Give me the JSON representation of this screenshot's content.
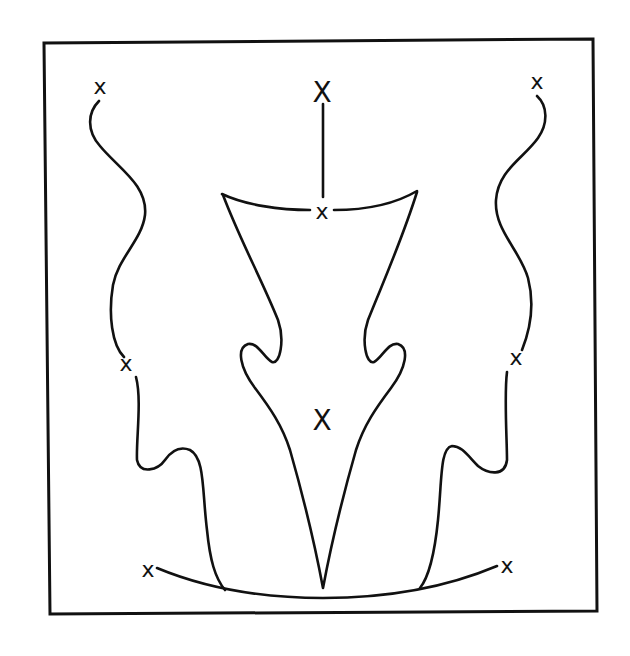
{
  "diagram": {
    "type": "line-drawing",
    "colors": {
      "line": "#111111",
      "background": "#ffffff"
    },
    "frame": {
      "points": "44,43 593,39 597,611 50,614"
    },
    "markers": [
      {
        "id": "top-left",
        "label": "x",
        "x": 100,
        "y": 86,
        "size": 22
      },
      {
        "id": "top-center",
        "label": "X",
        "x": 322,
        "y": 92,
        "size": 28
      },
      {
        "id": "top-right",
        "label": "x",
        "x": 537,
        "y": 81,
        "size": 22
      },
      {
        "id": "neck",
        "label": "x",
        "x": 322,
        "y": 211,
        "size": 22
      },
      {
        "id": "mid-left",
        "label": "x",
        "x": 126,
        "y": 363,
        "size": 22
      },
      {
        "id": "mid-right",
        "label": "x",
        "x": 516,
        "y": 357,
        "size": 22
      },
      {
        "id": "center",
        "label": "X",
        "x": 322,
        "y": 420,
        "size": 28
      },
      {
        "id": "bottom-left",
        "label": "x",
        "x": 148,
        "y": 569,
        "size": 22
      },
      {
        "id": "bottom-right",
        "label": "x",
        "x": 507,
        "y": 565,
        "size": 22
      }
    ],
    "paths": [
      {
        "id": "left-upper-curve",
        "d": "M 99 101 C 88 112, 86 130, 100 146 C 118 168, 148 185, 145 215 C 142 240, 118 258, 113 285 C 108 315, 112 345, 124 357"
      },
      {
        "id": "left-lower-curve",
        "d": "M 136 377 C 142 400, 136 440, 137 460 C 140 475, 158 470, 165 460 C 172 450, 180 446, 190 450 C 205 458, 202 490, 207 530 C 210 560, 215 578, 225 590"
      },
      {
        "id": "right-upper-curve",
        "d": "M 537 96 C 548 106, 548 124, 538 138 C 524 158, 498 170, 496 200 C 494 230, 520 250, 528 278 C 535 305, 530 330, 522 350"
      },
      {
        "id": "right-lower-curve",
        "d": "M 507 372 C 504 395, 507 440, 507 460 C 505 477, 488 474, 478 466 C 468 456, 462 446, 452 446 C 440 448, 442 480, 438 520 C 434 560, 428 578, 420 588"
      },
      {
        "id": "top-center-stem",
        "d": "M 323 104 L 323 197"
      },
      {
        "id": "neck-arc-left",
        "d": "M 222 194 C 245 205, 280 210, 310 210"
      },
      {
        "id": "neck-arc-right",
        "d": "M 334 210 C 365 210, 395 204, 417 191"
      },
      {
        "id": "central-shape",
        "d": "M 223 195 C 240 240, 262 280, 278 320 C 285 340, 280 365, 272 362 C 264 358, 258 342, 248 344 C 236 348, 240 368, 255 388 C 270 408, 282 425, 290 450 C 300 485, 314 540, 323 588 C 332 540, 346 485, 356 450 C 364 425, 376 408, 391 388 C 406 368, 410 348, 398 344 C 388 342, 382 358, 374 362 C 366 365, 361 340, 368 320 C 384 280, 402 240, 417 192"
      },
      {
        "id": "bottom-arc",
        "d": "M 157 568 C 210 590, 270 598, 323 598 C 380 598, 440 590, 497 566"
      }
    ]
  }
}
